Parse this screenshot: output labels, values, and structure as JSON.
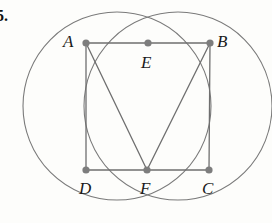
{
  "figure": {
    "problem_number": "5.",
    "background_color": "#fdfdfb",
    "stroke_color": "#6f6f6f",
    "arc_color": "#7a7a7a",
    "vertex_color": "#7d7d7d",
    "label_color": "#1a1a1a",
    "canvas": {
      "width": 272,
      "height": 223
    },
    "vertices": [
      {
        "id": "A",
        "label": "A",
        "x": 86,
        "y": 43,
        "label_x": 63,
        "label_y": 33
      },
      {
        "id": "B",
        "label": "B",
        "x": 210,
        "y": 43,
        "label_x": 217,
        "label_y": 33
      },
      {
        "id": "C",
        "label": "C",
        "x": 209,
        "y": 170,
        "label_x": 202,
        "label_y": 180
      },
      {
        "id": "D",
        "label": "D",
        "x": 86,
        "y": 170,
        "label_x": 79,
        "label_y": 180
      },
      {
        "id": "E",
        "label": "E",
        "x": 148,
        "y": 43,
        "label_x": 141,
        "label_y": 54
      },
      {
        "id": "F",
        "label": "F",
        "x": 147,
        "y": 170,
        "label_x": 140,
        "label_y": 180
      }
    ],
    "segments": [
      {
        "name": "segment-AB",
        "from": "A",
        "to": "B",
        "x1": 86,
        "y1": 43,
        "x2": 210,
        "y2": 43
      },
      {
        "name": "segment-DC",
        "from": "D",
        "to": "C",
        "x1": 86,
        "y1": 170,
        "x2": 209,
        "y2": 170
      },
      {
        "name": "segment-AD",
        "from": "A",
        "to": "D",
        "x1": 86,
        "y1": 43,
        "x2": 86,
        "y2": 170
      },
      {
        "name": "segment-BC",
        "from": "B",
        "to": "C",
        "x1": 210,
        "y1": 43,
        "x2": 209,
        "y2": 170
      },
      {
        "name": "segment-AF",
        "from": "A",
        "to": "F",
        "x1": 86,
        "y1": 43,
        "x2": 147,
        "y2": 170
      },
      {
        "name": "segment-BF",
        "from": "B",
        "to": "F",
        "x1": 210,
        "y1": 43,
        "x2": 147,
        "y2": 170
      }
    ],
    "circles": [
      {
        "name": "left-circle",
        "cx": 117,
        "cy": 106,
        "r": 94,
        "through": "A, E, F, D"
      },
      {
        "name": "right-circle",
        "cx": 178,
        "cy": 106,
        "r": 94,
        "through": "E, B, C, F"
      }
    ],
    "vertex_dot_radius": 3.6,
    "line_width": 1.3,
    "arc_width": 1.1
  }
}
